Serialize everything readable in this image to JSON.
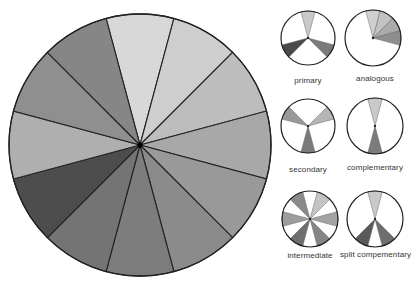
{
  "main_wheel": {
    "center": [
      140,
      145
    ],
    "radius": 131,
    "segment_count": 12,
    "segment_colors": [
      "#d8d8d8",
      "#cecece",
      "#bdbdbd",
      "#a8a8a8",
      "#999999",
      "#8b8b8b",
      "#7d7d7d",
      "#747474",
      "#6c6c6c",
      "#4d4d4d",
      "#afafaf",
      "#8f8f8f",
      "#868686"
    ],
    "outline": "#222222"
  },
  "small_wheels": [
    {
      "label": "primary",
      "center": [
        308,
        38
      ],
      "radius": 27,
      "wedges": [
        {
          "seg": 0,
          "color": "#c9c9c9"
        },
        {
          "seg": 4,
          "color": "#7a7a7a"
        },
        {
          "seg": 8,
          "color": "#4a4a4a"
        }
      ]
    },
    {
      "label": "analogous",
      "center": [
        373,
        38
      ],
      "radius": 28,
      "wedges": [
        {
          "seg": 0,
          "color": "#cfcfcf"
        },
        {
          "seg": 1,
          "color": "#c2c2c2"
        },
        {
          "seg": 2,
          "color": "#ababab"
        },
        {
          "seg": 3,
          "color": "#8e8e8e"
        }
      ]
    },
    {
      "label": "secondary",
      "center": [
        308,
        126
      ],
      "radius": 27,
      "wedges": [
        {
          "seg": 2,
          "color": "#b5b5b5"
        },
        {
          "seg": 6,
          "color": "#7b7b7b"
        },
        {
          "seg": 10,
          "color": "#999999"
        }
      ]
    },
    {
      "label": "complementary",
      "center": [
        375,
        126
      ],
      "radius": 28,
      "wedges": [
        {
          "seg": 0,
          "color": "#c9c9c9"
        },
        {
          "seg": 6,
          "color": "#7b7b7b"
        }
      ]
    },
    {
      "label": "intermediate",
      "center": [
        310,
        219
      ],
      "radius": 28,
      "wedges": [
        {
          "seg": 1,
          "color": "#c4c4c4"
        },
        {
          "seg": 3,
          "color": "#a3a3a3"
        },
        {
          "seg": 5,
          "color": "#858585"
        },
        {
          "seg": 7,
          "color": "#6e6e6e"
        },
        {
          "seg": 9,
          "color": "#9d9d9d"
        },
        {
          "seg": 11,
          "color": "#8a8a8a"
        }
      ]
    },
    {
      "label": "split compementary",
      "center": [
        375,
        219
      ],
      "radius": 28,
      "wedges": [
        {
          "seg": 0,
          "color": "#c9c9c9"
        },
        {
          "seg": 5,
          "color": "#6e6e6e"
        },
        {
          "seg": 7,
          "color": "#5a5a5a"
        }
      ]
    }
  ],
  "labels": {
    "primary": "primary",
    "analogous": "analogous",
    "secondary": "secondary",
    "complementary": "complementary",
    "intermediate": "intermediate",
    "split": "split compementary"
  }
}
